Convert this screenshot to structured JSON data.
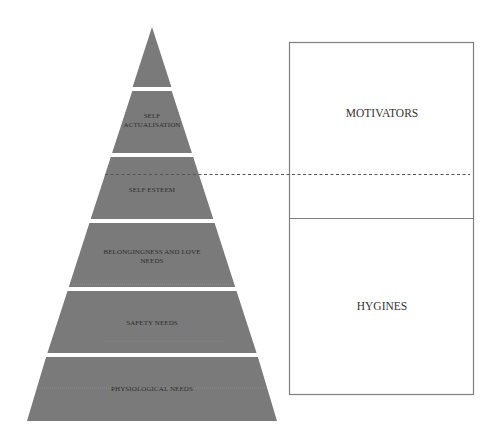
{
  "diagram": {
    "pyramid": {
      "fill_color": "#7a7a7a",
      "levels": [
        {
          "label_lines": [
            ""
          ]
        },
        {
          "label_lines": [
            "SELF",
            "ACTUALISATION"
          ]
        },
        {
          "label_lines": [
            "SELF ESTEEM"
          ]
        },
        {
          "label_lines": [
            "BELONGINGNESS AND LOVE",
            "NEEDS"
          ]
        },
        {
          "label_lines": [
            "SAFETY NEEDS"
          ]
        },
        {
          "label_lines": [
            "PHYSIOLOGICAL NEEDS"
          ]
        }
      ]
    },
    "herzberg_box": {
      "top_label": "MOTIVATORS",
      "bottom_label": "HYGINES",
      "border_color": "#7f7f7f"
    },
    "divider": {
      "style": "dashed",
      "color": "#555555"
    }
  }
}
